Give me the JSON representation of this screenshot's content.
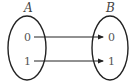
{
  "diagram": {
    "type": "function-mapping",
    "sets": [
      {
        "name": "A",
        "elements": [
          "0",
          "1"
        ]
      },
      {
        "name": "B",
        "elements": [
          "0",
          "1"
        ]
      }
    ],
    "mappings": [
      {
        "from": "0",
        "to": "0"
      },
      {
        "from": "1",
        "to": "1"
      }
    ]
  },
  "labels": {
    "set_a": "A",
    "set_b": "B",
    "a0": "0",
    "a1": "1",
    "b0": "0",
    "b1": "1"
  },
  "colors": {
    "stroke": "#222222",
    "text": "#555555"
  }
}
